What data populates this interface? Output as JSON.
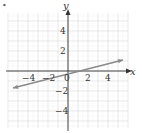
{
  "marker": "•",
  "chart_data": {
    "type": "line",
    "title": "",
    "xlabel": "x",
    "ylabel": "y",
    "xlim": [
      -6,
      6
    ],
    "ylim": [
      -6,
      6
    ],
    "grid": true,
    "x_ticks": [
      "-4",
      "-2",
      "0",
      "2",
      "4"
    ],
    "y_ticks": [
      "4",
      "2",
      "-2",
      "-4"
    ],
    "series": [
      {
        "name": "line",
        "points": [
          [
            -5.5,
            -1.7
          ],
          [
            5.5,
            1.1
          ]
        ],
        "arrows": "both",
        "color": "#8a8a8a"
      }
    ],
    "x_intercept": 1
  },
  "colors": {
    "grid": "#d9d9d9",
    "axis": "#333333",
    "line": "#8a8a8a"
  }
}
